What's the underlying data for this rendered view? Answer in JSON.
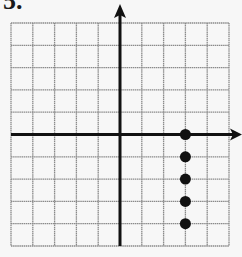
{
  "problem_label": "5.",
  "chart_data": {
    "type": "scatter",
    "title": "",
    "xlabel": "",
    "ylabel": "",
    "xlim": [
      -5,
      5
    ],
    "ylim": [
      -5,
      5
    ],
    "grid": true,
    "axes_arrows": [
      "+x",
      "+y"
    ],
    "series": [
      {
        "name": "points",
        "x": [
          3,
          3,
          3,
          3,
          3
        ],
        "y": [
          0,
          -1,
          -2,
          -3,
          -4
        ]
      }
    ]
  },
  "colors": {
    "grid": "#8a8a8a",
    "axis": "#111111",
    "point": "#111111",
    "background": "#f7f7f7"
  }
}
